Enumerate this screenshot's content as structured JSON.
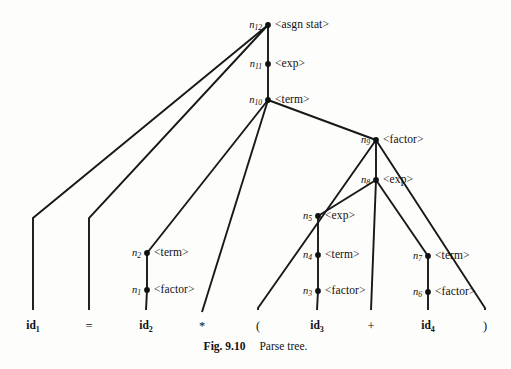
{
  "figure": {
    "caption_label": "Fig. 9.10",
    "caption_text": "Parse tree."
  },
  "diagram": {
    "type": "parse-tree",
    "ink_color": "#181818",
    "background_color": "#fdfdfc",
    "nodes": [
      {
        "id": "n12",
        "name": "n",
        "sub": "12",
        "symbol": "<asgn stat>",
        "x": 268,
        "y": 25
      },
      {
        "id": "n11",
        "name": "n",
        "sub": "11",
        "symbol": "<exp>",
        "x": 268,
        "y": 64
      },
      {
        "id": "n10",
        "name": "n",
        "sub": "10",
        "symbol": "<term>",
        "x": 268,
        "y": 100
      },
      {
        "id": "n9",
        "name": "n",
        "sub": "9",
        "symbol": "<factor>",
        "x": 376,
        "y": 140
      },
      {
        "id": "n8",
        "name": "n",
        "sub": "8",
        "symbol": "<exp>",
        "x": 376,
        "y": 180
      },
      {
        "id": "n5",
        "name": "n",
        "sub": "5",
        "symbol": "<exp>",
        "x": 318,
        "y": 216
      },
      {
        "id": "n4",
        "name": "n",
        "sub": "4",
        "symbol": "<term>",
        "x": 318,
        "y": 255
      },
      {
        "id": "n3",
        "name": "n",
        "sub": "3",
        "symbol": "<factor>",
        "x": 318,
        "y": 291
      },
      {
        "id": "n7",
        "name": "n",
        "sub": "7",
        "symbol": "<term>",
        "x": 428,
        "y": 256
      },
      {
        "id": "n6",
        "name": "n",
        "sub": "6",
        "symbol": "<factor>",
        "x": 428,
        "y": 292
      },
      {
        "id": "n2",
        "name": "n",
        "sub": "2",
        "symbol": "<term>",
        "x": 147,
        "y": 253
      },
      {
        "id": "n1",
        "name": "n",
        "sub": "1",
        "symbol": "<factor>",
        "x": 147,
        "y": 290
      }
    ],
    "leaves": [
      {
        "id": "leaf-id1",
        "text": "id",
        "sub": "1",
        "bold": true,
        "x": 33,
        "y": 320
      },
      {
        "id": "leaf-eq",
        "text": "=",
        "sub": "",
        "bold": false,
        "x": 89,
        "y": 320
      },
      {
        "id": "leaf-id2",
        "text": "id",
        "sub": "2",
        "bold": true,
        "x": 146,
        "y": 320
      },
      {
        "id": "leaf-star",
        "text": "*",
        "sub": "",
        "bold": false,
        "x": 202,
        "y": 320
      },
      {
        "id": "leaf-lpar",
        "text": "(",
        "sub": "",
        "bold": false,
        "x": 258,
        "y": 320
      },
      {
        "id": "leaf-id3",
        "text": "id",
        "sub": "3",
        "bold": true,
        "x": 317,
        "y": 320
      },
      {
        "id": "leaf-plus",
        "text": "+",
        "sub": "",
        "bold": false,
        "x": 371,
        "y": 320
      },
      {
        "id": "leaf-id4",
        "text": "id",
        "sub": "4",
        "bold": true,
        "x": 428,
        "y": 320
      },
      {
        "id": "leaf-rpar",
        "text": ")",
        "sub": "",
        "bold": false,
        "x": 485,
        "y": 320
      }
    ],
    "edges": [
      {
        "from": "n12",
        "to": "leaf-id1",
        "points": "268,25 33,218 33,310"
      },
      {
        "from": "n12",
        "to": "leaf-eq",
        "points": "268,25 89,218 89,310"
      },
      {
        "from": "n12",
        "to": "n11",
        "points": "268,25 268,64"
      },
      {
        "from": "n11",
        "to": "n10",
        "points": "268,64 268,100"
      },
      {
        "from": "n10",
        "to": "n2",
        "points": "268,100 147,253"
      },
      {
        "from": "n10",
        "to": "leaf-star",
        "points": "268,100 202,312"
      },
      {
        "from": "n10",
        "to": "n9",
        "points": "268,100 376,140"
      },
      {
        "from": "n9",
        "to": "leaf-lpar",
        "points": "376,140 258,308 258,310"
      },
      {
        "from": "n9",
        "to": "n8",
        "points": "376,140 376,180"
      },
      {
        "from": "n9",
        "to": "leaf-rpar",
        "points": "376,140 485,308 485,310"
      },
      {
        "from": "n8",
        "to": "n5",
        "points": "376,180 318,216"
      },
      {
        "from": "n8",
        "to": "leaf-plus",
        "points": "376,180 371,310"
      },
      {
        "from": "n8",
        "to": "n7",
        "points": "376,180 428,256"
      },
      {
        "from": "n5",
        "to": "n4",
        "points": "318,216 318,255"
      },
      {
        "from": "n4",
        "to": "n3",
        "points": "318,255 318,291"
      },
      {
        "from": "n3",
        "to": "leaf-id3",
        "points": "318,291 317,310"
      },
      {
        "from": "n7",
        "to": "n6",
        "points": "428,256 428,292"
      },
      {
        "from": "n6",
        "to": "leaf-id4",
        "points": "428,292 428,310"
      },
      {
        "from": "n2",
        "to": "n1",
        "points": "147,253 147,290"
      },
      {
        "from": "n1",
        "to": "leaf-id2",
        "points": "147,290 146,310"
      }
    ]
  }
}
